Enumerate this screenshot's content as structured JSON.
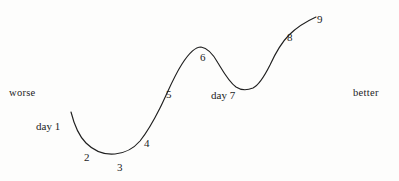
{
  "figure": {
    "background_color": "#fdfdfc",
    "line_color": "#1f1f1f",
    "text_color": "#1c1c1c",
    "axis_labels": {
      "left": "worse",
      "right": "better"
    }
  },
  "chart_data": {
    "type": "line",
    "title": "",
    "xlabel": "",
    "ylabel": "",
    "grid": false,
    "legend": null,
    "axis_annotations": {
      "left_end": "worse",
      "right_end": "better"
    },
    "categories": [
      "day 1",
      "2",
      "3",
      "4",
      "5",
      "6",
      "day 7",
      "8",
      "9"
    ],
    "point_labels": [
      "day 1",
      "2",
      "3",
      "4",
      "5",
      "6",
      "day 7",
      "8",
      "9"
    ],
    "x": [
      1,
      2,
      3,
      4,
      5,
      6,
      7,
      8,
      9
    ],
    "values": [
      69,
      31,
      26,
      47,
      84,
      131,
      93,
      145,
      165
    ],
    "ylim": [
      0,
      181
    ],
    "xlim": [
      0,
      399
    ],
    "points_px": [
      {
        "label": "day 1",
        "x": 71,
        "y": 112
      },
      {
        "label": "2",
        "x": 95,
        "y": 147
      },
      {
        "label": "3",
        "x": 121,
        "y": 153
      },
      {
        "label": "4",
        "x": 144,
        "y": 134
      },
      {
        "label": "5",
        "x": 166,
        "y": 97
      },
      {
        "label": "6",
        "x": 200,
        "y": 48
      },
      {
        "label": "day 7",
        "x": 250,
        "y": 88
      },
      {
        "label": "8",
        "x": 286,
        "y": 38
      },
      {
        "label": "9",
        "x": 316,
        "y": 17
      }
    ],
    "label_positions_px": [
      {
        "text": "day 1",
        "x": 36,
        "y": 120
      },
      {
        "text": "2",
        "x": 84,
        "y": 151
      },
      {
        "text": "3",
        "x": 117,
        "y": 161
      },
      {
        "text": "4",
        "x": 144,
        "y": 137
      },
      {
        "text": "5",
        "x": 166,
        "y": 88
      },
      {
        "text": "6",
        "x": 200,
        "y": 51
      },
      {
        "text": "day 7",
        "x": 211,
        "y": 89
      },
      {
        "text": "8",
        "x": 287,
        "y": 31
      },
      {
        "text": "9",
        "x": 317,
        "y": 13
      }
    ],
    "path": "M71,112 C74,124 79,136 86,143 C94,151 104,155 115,154 C126,153 134,148 140,141 C148,131 154,120 160,108 C167,94 173,78 182,64 C189,53 195,47 201,47 C208,48 213,54 218,63 C224,73 229,82 236,87 C242,91 248,90 253,88 C259,85 264,77 270,65 C276,52 282,42 289,35 C296,28 305,22 316,17"
  }
}
